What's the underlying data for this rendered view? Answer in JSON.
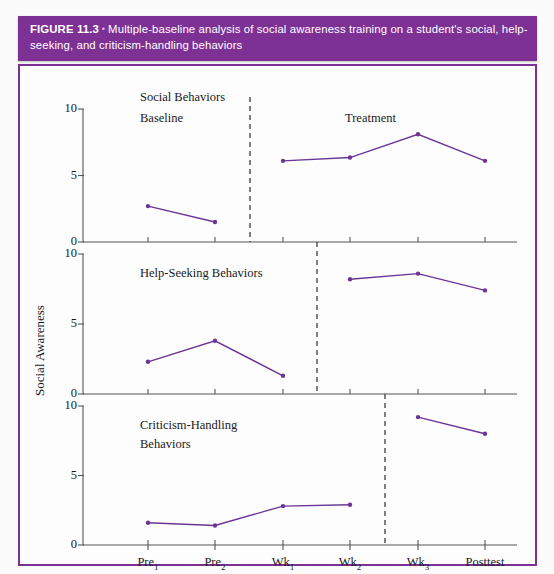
{
  "figure": {
    "number_label": "FIGURE 11.3",
    "separator": "•",
    "caption": "Multiple-baseline analysis of social awareness training on a student's social, help-seeking, and criticism-handling behaviors",
    "header_color": "#7d3194",
    "line_color": "#6b3596",
    "frame_color": "#7d3194"
  },
  "chart_data": {
    "type": "line",
    "title": "Multiple-baseline analysis of social awareness training on a student's social, help-seeking, and criticism-handling behaviors",
    "xlabel": "",
    "ylabel": "Social Awareness",
    "x": [
      "Pre₁",
      "Pre₂",
      "Wk₁",
      "Wk₂",
      "Wk₃",
      "Posttest"
    ],
    "x_plain": [
      "Pre1",
      "Pre2",
      "Wk1",
      "Wk2",
      "Wk3",
      "Posttest"
    ],
    "ylim": [
      0,
      10
    ],
    "yticks": [
      0,
      5,
      10
    ],
    "grid": false,
    "legend": "none",
    "phase_labels": [
      "Baseline",
      "Treatment"
    ],
    "panels": [
      {
        "name": "Social Behaviors",
        "title": "Social Behaviors",
        "phase_split_after": "Pre₂",
        "baseline": {
          "x": [
            "Pre₁",
            "Pre₂"
          ],
          "values": [
            2.7,
            1.5
          ]
        },
        "treatment": {
          "x": [
            "Wk₁",
            "Wk₂",
            "Wk₃",
            "Posttest"
          ],
          "values": [
            6.1,
            6.35,
            8.1,
            6.1
          ]
        }
      },
      {
        "name": "Help-Seeking Behaviors",
        "title": "Help-Seeking Behaviors",
        "phase_split_after": "Wk₁",
        "baseline": {
          "x": [
            "Pre₁",
            "Pre₂",
            "Wk₁"
          ],
          "values": [
            2.3,
            3.8,
            1.3
          ]
        },
        "treatment": {
          "x": [
            "Wk₂",
            "Wk₃",
            "Posttest"
          ],
          "values": [
            8.2,
            8.6,
            7.4
          ]
        }
      },
      {
        "name": "Criticism-Handling Behaviors",
        "title_line1": "Criticism-Handling",
        "title_line2": "Behaviors",
        "phase_split_after": "Wk₂",
        "baseline": {
          "x": [
            "Pre₁",
            "Pre₂",
            "Wk₁",
            "Wk₂"
          ],
          "values": [
            1.6,
            1.4,
            2.8,
            2.9
          ]
        },
        "treatment": {
          "x": [
            "Wk₃",
            "Posttest"
          ],
          "values": [
            9.2,
            8.0
          ]
        }
      }
    ],
    "ytick_labels": [
      "0",
      "5",
      "10"
    ]
  }
}
